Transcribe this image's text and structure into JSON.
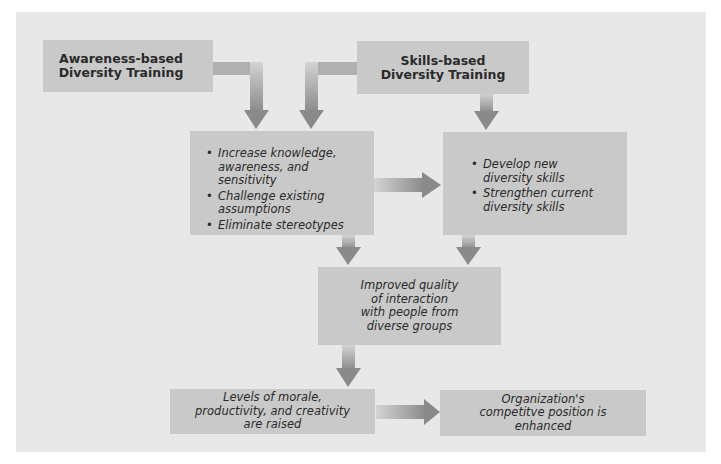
{
  "diagram": {
    "colors": {
      "panel": "#e8e8e8",
      "box": "#c9c9c9",
      "arrow_dark": "#8a8a8a",
      "arrow_light": "#d2d2d2",
      "text": "#2a2a2a"
    },
    "awareness_box": {
      "line1": "Awareness-based",
      "line2": "Diversity Training"
    },
    "skills_box": {
      "line1": "Skills-based",
      "line2": "Diversity Training"
    },
    "awareness_outcomes": {
      "items": [
        "Increase knowledge, awareness, and sensitivity",
        "Challenge existing assumptions",
        "Eliminate stereotypes"
      ]
    },
    "skills_outcomes": {
      "items": [
        "Develop new diversity skills",
        "Strengthen current diversity skills"
      ]
    },
    "interaction_box": {
      "text": "Improved quality of interaction with people from diverse groups"
    },
    "morale_box": {
      "text": "Levels of morale, productivity, and creativity are raised"
    },
    "competitive_box": {
      "text": "Organization's competitve position is enhanced"
    }
  }
}
